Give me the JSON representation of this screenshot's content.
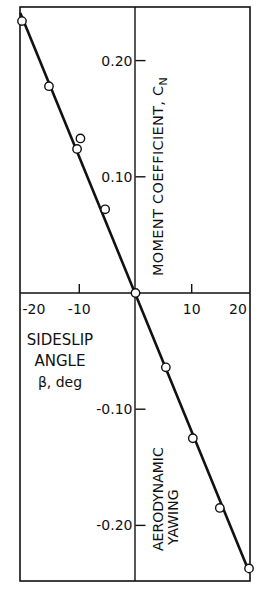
{
  "chart_data": {
    "type": "scatter",
    "title": "",
    "xlabel": "SIDESLIP ANGLE β, deg",
    "xlabel_lines": [
      "SIDESLIP",
      "ANGLE",
      "β, deg"
    ],
    "ylabel": "AERODYNAMIC YAWING MOMENT COEFFICIENT, C_N",
    "ylabel_upper": "MOMENT COEFFICIENT, C",
    "ylabel_upper_sub": "N",
    "ylabel_lower_lines": [
      "AERODYNAMIC",
      "YAWING"
    ],
    "xlim": [
      -20.5,
      20.3
    ],
    "ylim": [
      -0.248,
      0.246
    ],
    "x_ticks": [
      -20,
      -10,
      10,
      20
    ],
    "x_tick_labels": [
      "-20",
      "-10",
      "10",
      "20"
    ],
    "y_ticks": [
      0.2,
      0.1,
      -0.1,
      -0.2
    ],
    "y_tick_labels": [
      "0.20",
      "0.10",
      "-0.10",
      "-0.20"
    ],
    "grid": false,
    "legend": null,
    "series": [
      {
        "name": "Measured",
        "marker": "open-circle",
        "x": [
          -20.2,
          -15.4,
          -9.8,
          -10.4,
          -5.4,
          0.0,
          5.4,
          10.2,
          15.0,
          20.2
        ],
        "y": [
          0.234,
          0.178,
          0.133,
          0.124,
          0.072,
          0.0,
          -0.064,
          -0.125,
          -0.185,
          -0.237
        ]
      }
    ],
    "fit_line": {
      "x": [
        -20.5,
        20.3
      ],
      "y": [
        0.241,
        -0.241
      ]
    }
  }
}
